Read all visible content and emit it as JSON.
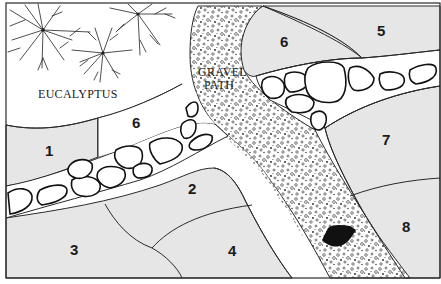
{
  "labels": {
    "eucalyptus": "EUCALYPTUS",
    "gravel_line1": "GRAVEL",
    "gravel_line2": "PATH"
  },
  "plots": [
    {
      "id": "1",
      "label": "1"
    },
    {
      "id": "2",
      "label": "2"
    },
    {
      "id": "3",
      "label": "3"
    },
    {
      "id": "4",
      "label": "4"
    },
    {
      "id": "5",
      "label": "5"
    },
    {
      "id": "6a",
      "label": "6"
    },
    {
      "id": "6b",
      "label": "6"
    },
    {
      "id": "7",
      "label": "7"
    },
    {
      "id": "8",
      "label": "8"
    }
  ],
  "colors": {
    "plot_fill": "#e6e6e6",
    "line": "#2a2a2a",
    "background": "#ffffff",
    "rock": "#111111"
  }
}
